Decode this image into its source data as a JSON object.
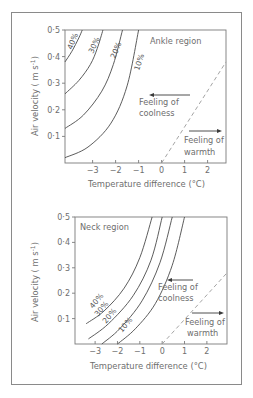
{
  "chart_data": [
    {
      "type": "line",
      "title": "Ankle region",
      "xlabel": "Temperature difference (°C)",
      "ylabel": "Air velocity ( m s⁻¹)",
      "xlim": [
        -4.2,
        2.8
      ],
      "ylim": [
        0,
        0.5
      ],
      "xticks": [
        -3,
        -2,
        -1,
        0,
        1,
        2
      ],
      "xtick_labels": [
        "−3",
        "−2",
        "−1",
        "0",
        "1",
        "2"
      ],
      "yticks": [
        0.1,
        0.2,
        0.3,
        0.4,
        0.5
      ],
      "ytick_labels": [
        "0·1",
        "0·2",
        "0·3",
        "0·4",
        "0·5"
      ],
      "grid": false,
      "series": [
        {
          "name": "40%",
          "x": [
            -4.2,
            -3.9,
            -3.6,
            -3.45
          ],
          "y": [
            0.38,
            0.42,
            0.47,
            0.5
          ]
        },
        {
          "name": "30%",
          "x": [
            -4.2,
            -3.6,
            -3.1,
            -2.8,
            -2.55
          ],
          "y": [
            0.26,
            0.31,
            0.37,
            0.43,
            0.5
          ]
        },
        {
          "name": "20%",
          "x": [
            -4.2,
            -3.4,
            -2.6,
            -2.1,
            -1.7
          ],
          "y": [
            0.13,
            0.18,
            0.27,
            0.37,
            0.5
          ]
        },
        {
          "name": "10%",
          "x": [
            -4.2,
            -3.2,
            -2.2,
            -1.5,
            -1.0
          ],
          "y": [
            0.02,
            0.06,
            0.15,
            0.29,
            0.5
          ]
        },
        {
          "name": "neutral (dashed)",
          "x": [
            0,
            2.8
          ],
          "y": [
            0,
            0.38
          ],
          "style": "dashed"
        }
      ],
      "annotations": [
        {
          "text": "Feeling of coolness",
          "arrow": "left"
        },
        {
          "text": "Feeling of warmth",
          "arrow": "right"
        }
      ]
    },
    {
      "type": "line",
      "title": "Neck region",
      "xlabel": "Temperature difference (°C)",
      "ylabel": "Air velocity ( m s⁻¹)",
      "xlim": [
        -3.9,
        2.9
      ],
      "ylim": [
        0,
        0.5
      ],
      "xticks": [
        -3,
        -2,
        -1,
        0,
        1,
        2
      ],
      "xtick_labels": [
        "−3",
        "−2",
        "−1",
        "0",
        "1",
        "2"
      ],
      "yticks": [
        0.1,
        0.2,
        0.3,
        0.4,
        0.5
      ],
      "ytick_labels": [
        "0·1",
        "0·2",
        "0·3",
        "0·4",
        "0·5"
      ],
      "grid": false,
      "series": [
        {
          "name": "40%",
          "x": [
            -3.4,
            -2.6,
            -1.7,
            -1.0,
            -0.45
          ],
          "y": [
            0.08,
            0.13,
            0.22,
            0.34,
            0.5
          ]
        },
        {
          "name": "30%",
          "x": [
            -3.3,
            -2.4,
            -1.3,
            -0.5,
            0.0
          ],
          "y": [
            0.02,
            0.08,
            0.19,
            0.33,
            0.5
          ]
        },
        {
          "name": "20%",
          "x": [
            -2.7,
            -1.9,
            -0.9,
            -0.1,
            0.45
          ],
          "y": [
            0.0,
            0.06,
            0.17,
            0.32,
            0.5
          ]
        },
        {
          "name": "10%",
          "x": [
            -2.0,
            -1.2,
            -0.3,
            0.45,
            1.0
          ],
          "y": [
            0.0,
            0.06,
            0.16,
            0.31,
            0.5
          ]
        },
        {
          "name": "neutral (dashed)",
          "x": [
            0,
            2.9
          ],
          "y": [
            0,
            0.28
          ],
          "style": "dashed"
        }
      ],
      "annotations": [
        {
          "text": "Feeling of coolness",
          "arrow": "left"
        },
        {
          "text": "Feeling of warmth",
          "arrow": "right"
        }
      ]
    }
  ],
  "charts": {
    "top": {
      "title": "Ankle region",
      "ylabel": "Air velocity ( m s",
      "ylabel_sup": "-1",
      "ylabel_end": ")",
      "xlabel": "Temperature difference (°C)",
      "coolness_line1": "Feeling of",
      "coolness_line2": "coolness",
      "warmth_line1": "Feeling of",
      "warmth_line2": "warmth",
      "pct_40": "40%",
      "pct_30": "30%",
      "pct_20": "20%",
      "pct_10": "10%"
    },
    "bottom": {
      "title": "Neck region",
      "ylabel": "Air velocity ( m s",
      "ylabel_sup": "-1",
      "ylabel_end": ")",
      "xlabel": "Temperature difference (°C)",
      "coolness_line1": "Feeling of",
      "coolness_line2": "coolness",
      "warmth_line1": "Feeling of",
      "warmth_line2": "warmth",
      "pct_40": "40%",
      "pct_30": "30%",
      "pct_20": "20%",
      "pct_10": "10%"
    }
  }
}
